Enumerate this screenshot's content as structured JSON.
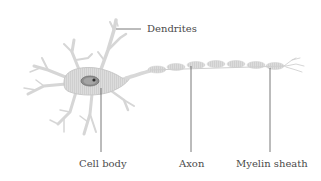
{
  "diagram": {
    "labels": {
      "dendrites": "Dendrites",
      "cell_body": "Cell body",
      "axon": "Axon",
      "myelin_sheath": "Myelin sheath"
    },
    "colors": {
      "cell": "#d9d9d9",
      "cell_stroke": "#c4c4c4",
      "nucleus": "#8c8c8c",
      "nucleolus": "#333333",
      "myelin": "#d0d0d0",
      "leader_line": "#555555",
      "text": "#4a4a4a"
    }
  }
}
